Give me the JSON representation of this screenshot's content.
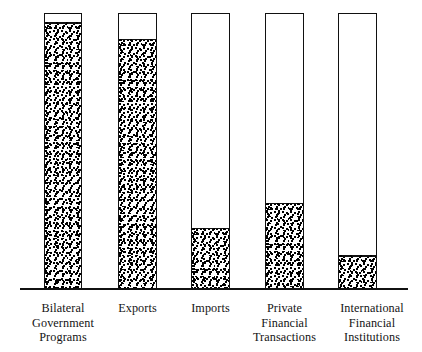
{
  "chart_data": {
    "type": "bar",
    "title": "",
    "subtitle": "",
    "xlabel": "",
    "ylabel": "",
    "grid": false,
    "legend": "none",
    "axis_ticks_visible": false,
    "note": "Vertical outlined bars of equal full height; each bar is partially filled from the bottom with a dense stipple pattern indicating a percentage of the whole.",
    "ylim": [
      0,
      100
    ],
    "categories": [
      "Bilateral Government Programs",
      "Exports",
      "Imports",
      "Private Financial Transactions",
      "International Financial Institutions"
    ],
    "values": [
      97,
      91,
      22,
      31,
      12
    ],
    "series": [
      {
        "name": "Filled share",
        "values": [
          97,
          91,
          22,
          31,
          12
        ]
      },
      {
        "name": "Unfilled share",
        "values": [
          3,
          9,
          78,
          69,
          88
        ]
      }
    ]
  },
  "axis": {
    "baseline_name": "x-axis-baseline"
  },
  "bars": [
    {
      "id": "bilateral-government-programs",
      "fill_percent": 97,
      "label_lines": [
        "Bilateral",
        "Government",
        "Programs"
      ]
    },
    {
      "id": "exports",
      "fill_percent": 91,
      "label_lines": [
        "Exports"
      ]
    },
    {
      "id": "imports",
      "fill_percent": 22,
      "label_lines": [
        "Imports"
      ]
    },
    {
      "id": "private-financial-transactions",
      "fill_percent": 31,
      "label_lines": [
        "Private",
        "Financial",
        "Transactions"
      ]
    },
    {
      "id": "international-financial-institutions",
      "fill_percent": 12,
      "label_lines": [
        "International",
        "Financial",
        "Institutions"
      ]
    }
  ],
  "colors": {
    "ink": "#111111",
    "background": "#ffffff",
    "fill_pattern": "#000000"
  }
}
